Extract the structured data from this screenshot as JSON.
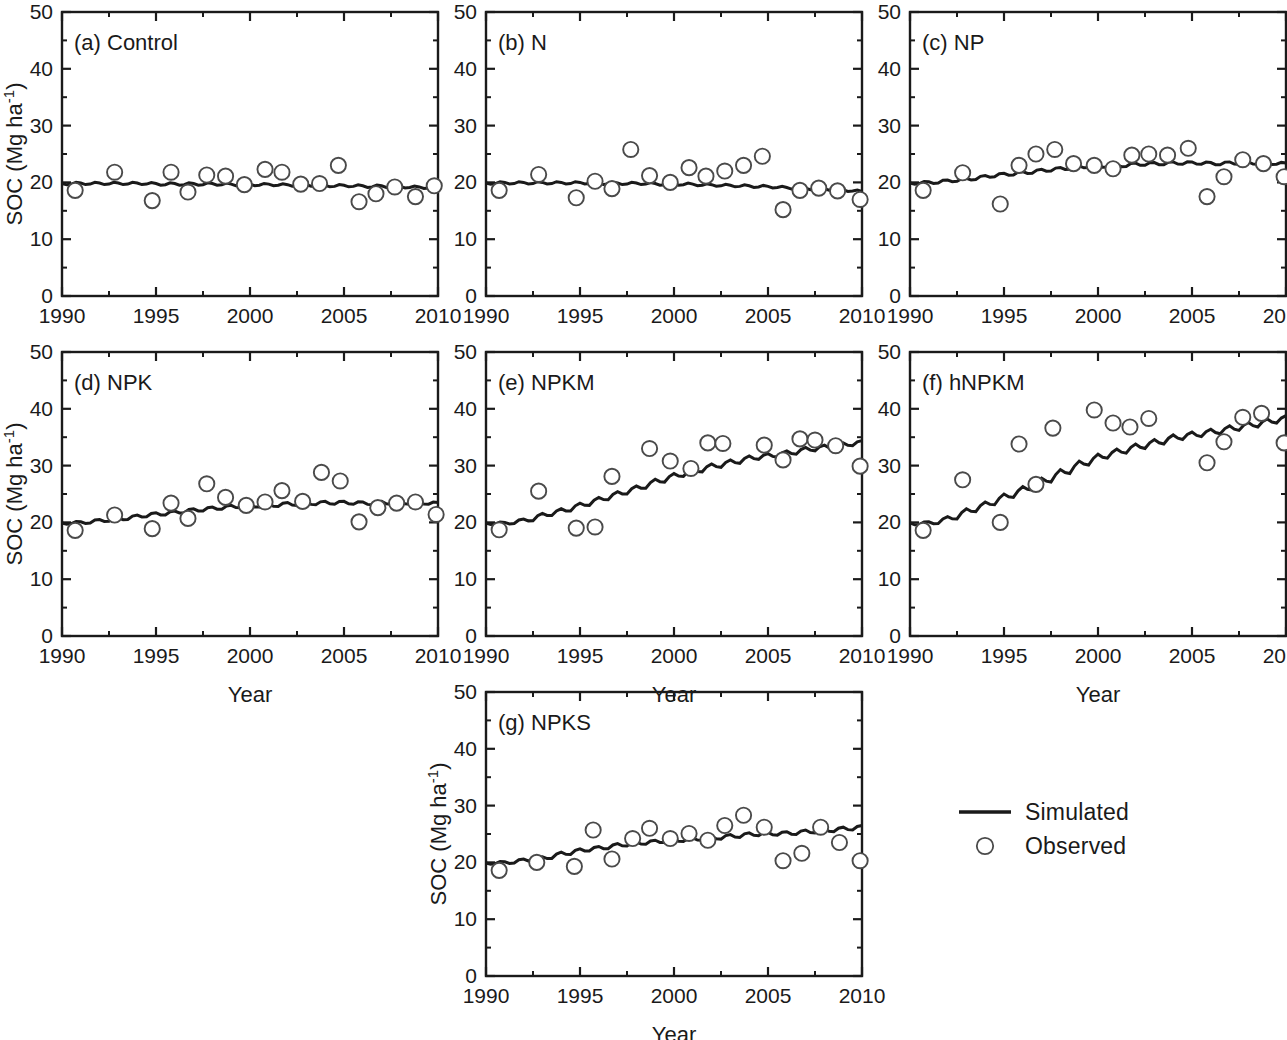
{
  "figure": {
    "axis_titles": {
      "y": "SOC (Mg ha",
      "y_sup": "-1",
      "y_close": ")",
      "x": "Year"
    },
    "y_ticks": [
      "0",
      "10",
      "20",
      "30",
      "40",
      "50"
    ],
    "x_ticks": [
      "1990",
      "1995",
      "2000",
      "2005",
      "2010"
    ],
    "legend": {
      "simulated_label": "Simulated",
      "observed_label": "Observed",
      "line_color": "#1a1a1a",
      "marker_color": "#ffffff",
      "marker_stroke": "#4a4a4a"
    }
  },
  "chart_data": {
    "type": "line",
    "title": "",
    "xlabel": "Year",
    "ylabel": "SOC (Mg ha-1)",
    "xlim": [
      1990,
      2010
    ],
    "ylim": [
      0,
      50
    ],
    "y_ticks": [
      0,
      10,
      20,
      30,
      40,
      50
    ],
    "x_ticks": [
      1990,
      1995,
      2000,
      2005,
      2010
    ],
    "grid": false,
    "legend_position": "bottom-right-outside",
    "series_names": [
      "Simulated",
      "Observed"
    ],
    "panels": [
      {
        "key": "a",
        "label": "(a)  Control",
        "show_ylabel": true,
        "show_xlabel": false,
        "simulated": {
          "name": "Simulated",
          "x": [
            1990.0,
            1990.5,
            1991.0,
            1991.5,
            1992.0,
            1992.5,
            1993.0,
            1993.5,
            1994.0,
            1994.5,
            1995.0,
            1995.5,
            1996.0,
            1996.5,
            1997.0,
            1997.5,
            1998.0,
            1998.5,
            1999.0,
            1999.5,
            2000.0,
            2000.5,
            2001.0,
            2001.5,
            2002.0,
            2002.5,
            2003.0,
            2003.5,
            2004.0,
            2004.5,
            2005.0,
            2005.5,
            2006.0,
            2006.5,
            2007.0,
            2007.5,
            2008.0,
            2008.5,
            2009.0,
            2009.5,
            2010.0
          ],
          "y": [
            19.8,
            19.7,
            19.9,
            19.7,
            19.9,
            19.7,
            19.9,
            19.7,
            19.9,
            19.7,
            19.8,
            19.6,
            19.8,
            19.6,
            19.8,
            19.6,
            19.8,
            19.6,
            19.7,
            19.5,
            19.7,
            19.5,
            19.7,
            19.5,
            19.6,
            19.4,
            19.6,
            19.4,
            19.5,
            19.3,
            19.5,
            19.3,
            19.4,
            19.2,
            19.4,
            19.2,
            19.3,
            19.1,
            19.2,
            19.0,
            19.0
          ]
        },
        "observed": {
          "name": "Observed",
          "x": [
            1990.7,
            1992.8,
            1994.8,
            1995.8,
            1996.7,
            1997.7,
            1998.7,
            1999.7,
            2000.8,
            2001.7,
            2002.7,
            2003.7,
            2004.7,
            2005.8,
            2006.7,
            2007.7,
            2008.8,
            2009.8
          ],
          "y": [
            18.6,
            21.8,
            16.8,
            21.8,
            18.3,
            21.3,
            21.1,
            19.6,
            22.3,
            21.8,
            19.7,
            19.8,
            23.0,
            16.6,
            18.0,
            19.2,
            17.5,
            19.4
          ]
        }
      },
      {
        "key": "b",
        "label": "(b) N",
        "show_ylabel": false,
        "show_xlabel": false,
        "simulated": {
          "name": "Simulated",
          "x": [
            1990.0,
            1990.5,
            1991.0,
            1991.5,
            1992.0,
            1992.5,
            1993.0,
            1993.5,
            1994.0,
            1994.5,
            1995.0,
            1995.5,
            1996.0,
            1996.5,
            1997.0,
            1997.5,
            1998.0,
            1998.5,
            1999.0,
            1999.5,
            2000.0,
            2000.5,
            2001.0,
            2001.5,
            2002.0,
            2002.5,
            2003.0,
            2003.5,
            2004.0,
            2004.5,
            2005.0,
            2005.5,
            2006.0,
            2006.5,
            2007.0,
            2007.5,
            2008.0,
            2008.5,
            2009.0,
            2009.5,
            2010.0
          ],
          "y": [
            19.9,
            19.8,
            20.0,
            19.8,
            20.0,
            19.8,
            20.0,
            19.8,
            20.0,
            19.8,
            20.0,
            19.8,
            19.9,
            19.7,
            19.9,
            19.7,
            19.9,
            19.7,
            19.8,
            19.6,
            19.8,
            19.6,
            19.7,
            19.5,
            19.6,
            19.4,
            19.5,
            19.3,
            19.4,
            19.2,
            19.3,
            19.1,
            19.1,
            18.9,
            19.0,
            18.8,
            18.9,
            18.7,
            18.7,
            18.5,
            18.4
          ]
        },
        "observed": {
          "name": "Observed",
          "x": [
            1990.7,
            1992.8,
            1994.8,
            1995.8,
            1996.7,
            1997.7,
            1998.7,
            1999.8,
            2000.8,
            2001.7,
            2002.7,
            2003.7,
            2004.7,
            2005.8,
            2006.7,
            2007.7,
            2008.7,
            2009.9
          ],
          "y": [
            18.6,
            21.4,
            17.3,
            20.2,
            18.9,
            25.8,
            21.2,
            20.0,
            22.6,
            21.1,
            22.0,
            23.0,
            24.6,
            15.2,
            18.6,
            19.0,
            18.5,
            17.0
          ]
        }
      },
      {
        "key": "c",
        "label": "(c) NP",
        "show_ylabel": false,
        "show_xlabel": false,
        "simulated": {
          "name": "Simulated",
          "x": [
            1990.0,
            1990.5,
            1991.0,
            1991.5,
            1992.0,
            1992.5,
            1993.0,
            1993.5,
            1994.0,
            1994.5,
            1995.0,
            1995.5,
            1996.0,
            1996.5,
            1997.0,
            1997.5,
            1998.0,
            1998.5,
            1999.0,
            1999.5,
            2000.0,
            2000.5,
            2001.0,
            2001.5,
            2002.0,
            2002.5,
            2003.0,
            2003.5,
            2004.0,
            2004.5,
            2005.0,
            2005.5,
            2006.0,
            2006.5,
            2007.0,
            2007.5,
            2008.0,
            2008.5,
            2009.0,
            2009.5,
            2010.0
          ],
          "y": [
            19.9,
            19.8,
            20.1,
            19.9,
            20.4,
            20.2,
            20.7,
            20.5,
            21.2,
            21.0,
            21.6,
            21.3,
            21.9,
            21.6,
            22.3,
            22.0,
            22.6,
            22.3,
            22.9,
            22.6,
            23.0,
            22.7,
            23.1,
            22.8,
            23.4,
            23.0,
            23.5,
            23.1,
            23.6,
            23.2,
            23.6,
            23.2,
            23.5,
            23.1,
            23.6,
            23.2,
            23.6,
            23.2,
            23.5,
            23.2,
            23.4
          ]
        },
        "observed": {
          "name": "Observed",
          "x": [
            1990.7,
            1992.8,
            1994.8,
            1995.8,
            1996.7,
            1997.7,
            1998.7,
            1999.8,
            2000.8,
            2001.8,
            2002.7,
            2003.7,
            2004.8,
            2005.8,
            2006.7,
            2007.7,
            2008.8,
            2009.9
          ],
          "y": [
            18.6,
            21.7,
            16.2,
            23.0,
            25.0,
            25.8,
            23.3,
            23.0,
            22.4,
            24.8,
            25.0,
            24.8,
            26.0,
            17.5,
            21.0,
            24.0,
            23.3,
            21.0
          ]
        }
      },
      {
        "key": "d",
        "label": "(d) NPK",
        "show_ylabel": true,
        "show_xlabel": true,
        "simulated": {
          "name": "Simulated",
          "x": [
            1990.0,
            1990.5,
            1991.0,
            1991.5,
            1992.0,
            1992.5,
            1993.0,
            1993.5,
            1994.0,
            1994.5,
            1995.0,
            1995.5,
            1996.0,
            1996.5,
            1997.0,
            1997.5,
            1998.0,
            1998.5,
            1999.0,
            1999.5,
            2000.0,
            2000.5,
            2001.0,
            2001.5,
            2002.0,
            2002.5,
            2003.0,
            2003.5,
            2004.0,
            2004.5,
            2005.0,
            2005.5,
            2006.0,
            2006.5,
            2007.0,
            2007.5,
            2008.0,
            2008.5,
            2009.0,
            2009.5,
            2010.0
          ],
          "y": [
            19.9,
            19.8,
            20.1,
            19.9,
            20.5,
            20.2,
            20.8,
            20.5,
            21.3,
            21.0,
            21.7,
            21.3,
            22.0,
            21.7,
            22.4,
            22.0,
            22.7,
            22.3,
            23.0,
            22.6,
            23.1,
            22.7,
            23.2,
            22.8,
            23.5,
            23.0,
            23.6,
            23.1,
            23.7,
            23.2,
            23.7,
            23.2,
            23.6,
            23.1,
            23.7,
            23.2,
            23.7,
            23.2,
            23.6,
            23.2,
            23.5
          ]
        },
        "observed": {
          "name": "Observed",
          "x": [
            1990.7,
            1992.8,
            1994.8,
            1995.8,
            1996.7,
            1997.7,
            1998.7,
            1999.8,
            2000.8,
            2001.7,
            2002.8,
            2003.8,
            2004.8,
            2005.8,
            2006.8,
            2007.8,
            2008.8,
            2009.9
          ],
          "y": [
            18.6,
            21.3,
            18.9,
            23.4,
            20.7,
            26.8,
            24.4,
            23.0,
            23.6,
            25.6,
            23.7,
            28.8,
            27.3,
            20.1,
            22.6,
            23.4,
            23.6,
            21.4
          ]
        }
      },
      {
        "key": "e",
        "label": "(e) NPKM",
        "show_ylabel": false,
        "show_xlabel": true,
        "simulated": {
          "name": "Simulated",
          "x": [
            1990.0,
            1990.5,
            1991.0,
            1991.5,
            1992.0,
            1992.5,
            1993.0,
            1993.5,
            1994.0,
            1994.5,
            1995.0,
            1995.5,
            1996.0,
            1996.5,
            1997.0,
            1997.5,
            1998.0,
            1998.5,
            1999.0,
            1999.5,
            2000.0,
            2000.5,
            2001.0,
            2001.5,
            2002.0,
            2002.5,
            2003.0,
            2003.5,
            2004.0,
            2004.5,
            2005.0,
            2005.5,
            2006.0,
            2006.5,
            2007.0,
            2007.5,
            2008.0,
            2008.5,
            2009.0,
            2009.5,
            2010.0
          ],
          "y": [
            19.9,
            19.7,
            20.0,
            19.8,
            20.6,
            20.3,
            21.6,
            21.2,
            22.4,
            22.0,
            23.4,
            23.0,
            24.4,
            24.0,
            25.4,
            25.0,
            26.4,
            26.0,
            27.6,
            27.1,
            28.6,
            28.1,
            29.4,
            28.9,
            30.3,
            29.7,
            31.0,
            30.4,
            31.7,
            31.1,
            32.1,
            31.5,
            32.6,
            32.0,
            33.2,
            32.6,
            33.6,
            33.0,
            34.0,
            33.5,
            34.4
          ]
        },
        "observed": {
          "name": "Observed",
          "x": [
            1990.7,
            1992.8,
            1994.8,
            1995.8,
            1996.7,
            1998.7,
            1999.8,
            2000.9,
            2001.8,
            2002.6,
            2004.8,
            2005.8,
            2006.7,
            2007.5,
            2008.6,
            2009.9
          ],
          "y": [
            18.7,
            25.5,
            19.0,
            19.2,
            28.1,
            33.0,
            30.8,
            29.5,
            34.0,
            33.9,
            33.6,
            31.0,
            34.7,
            34.5,
            33.5,
            29.9
          ]
        }
      },
      {
        "key": "f",
        "label": "(f) hNPKM",
        "show_ylabel": false,
        "show_xlabel": true,
        "simulated": {
          "name": "Simulated",
          "x": [
            1990.0,
            1990.5,
            1991.0,
            1991.5,
            1992.0,
            1992.5,
            1993.0,
            1993.5,
            1994.0,
            1994.5,
            1995.0,
            1995.5,
            1996.0,
            1996.5,
            1997.0,
            1997.5,
            1998.0,
            1998.5,
            1999.0,
            1999.5,
            2000.0,
            2000.5,
            2001.0,
            2001.5,
            2002.0,
            2002.5,
            2003.0,
            2003.5,
            2004.0,
            2004.5,
            2005.0,
            2005.5,
            2006.0,
            2006.5,
            2007.0,
            2007.5,
            2008.0,
            2008.5,
            2009.0,
            2009.5,
            2010.0
          ],
          "y": [
            19.9,
            19.6,
            20.1,
            19.8,
            21.0,
            20.6,
            22.4,
            21.9,
            23.6,
            23.1,
            25.0,
            24.4,
            26.3,
            25.7,
            27.8,
            27.1,
            29.3,
            28.6,
            30.8,
            30.1,
            32.0,
            31.3,
            32.9,
            32.2,
            33.8,
            33.0,
            34.6,
            33.8,
            35.4,
            34.6,
            35.9,
            35.1,
            36.4,
            35.6,
            37.0,
            36.2,
            37.6,
            36.8,
            38.2,
            37.5,
            38.8
          ]
        },
        "observed": {
          "name": "Observed",
          "x": [
            1990.7,
            1992.8,
            1994.8,
            1995.8,
            1996.7,
            1997.6,
            1999.8,
            2000.8,
            2001.7,
            2002.7,
            2005.8,
            2006.7,
            2007.7,
            2008.7,
            2009.9
          ],
          "y": [
            18.6,
            27.5,
            20.0,
            33.8,
            26.7,
            36.6,
            39.8,
            37.5,
            36.8,
            38.3,
            30.5,
            34.2,
            38.5,
            39.2,
            34.0
          ]
        }
      },
      {
        "key": "g",
        "label": "(g) NPKS",
        "show_ylabel": true,
        "show_xlabel": true,
        "simulated": {
          "name": "Simulated",
          "x": [
            1990.0,
            1990.5,
            1991.0,
            1991.5,
            1992.0,
            1992.5,
            1993.0,
            1993.5,
            1994.0,
            1994.5,
            1995.0,
            1995.5,
            1996.0,
            1996.5,
            1997.0,
            1997.5,
            1998.0,
            1998.5,
            1999.0,
            1999.5,
            2000.0,
            2000.5,
            2001.0,
            2001.5,
            2002.0,
            2002.5,
            2003.0,
            2003.5,
            2004.0,
            2004.5,
            2005.0,
            2005.5,
            2006.0,
            2006.5,
            2007.0,
            2007.5,
            2008.0,
            2008.5,
            2009.0,
            2009.5,
            2010.0
          ],
          "y": [
            19.9,
            19.8,
            20.1,
            19.9,
            20.6,
            20.3,
            21.0,
            20.7,
            21.8,
            21.4,
            22.4,
            22.0,
            22.8,
            22.4,
            23.3,
            22.9,
            23.6,
            23.2,
            23.9,
            23.5,
            24.1,
            23.7,
            24.3,
            23.9,
            24.6,
            24.1,
            24.9,
            24.4,
            25.2,
            24.7,
            25.3,
            24.8,
            25.4,
            24.9,
            25.7,
            25.2,
            25.9,
            25.4,
            26.2,
            25.7,
            26.5
          ]
        },
        "observed": {
          "name": "Observed",
          "x": [
            1990.7,
            1992.7,
            1994.7,
            1995.7,
            1996.7,
            1997.8,
            1998.7,
            1999.8,
            2000.8,
            2001.8,
            2002.7,
            2003.7,
            2004.8,
            2005.8,
            2006.8,
            2007.8,
            2008.8,
            2009.9
          ],
          "y": [
            18.6,
            20.0,
            19.3,
            25.7,
            20.6,
            24.2,
            26.0,
            24.2,
            25.1,
            23.9,
            26.5,
            28.3,
            26.2,
            20.3,
            21.6,
            26.2,
            23.5,
            20.3
          ]
        }
      }
    ]
  }
}
